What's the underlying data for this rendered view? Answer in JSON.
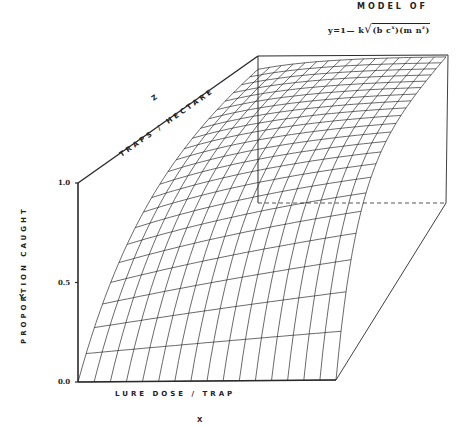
{
  "chart_data": {
    "type": "surface-3d-wireframe",
    "title": "MODEL OF",
    "subtitle": "y=1— k√(bc^x)(mn^z)",
    "equation_display": {
      "prefix": "y=1— k",
      "radicand": "(b c",
      "sup1": "x",
      "mid": ")(m n",
      "sup2": "z",
      "suffix": ")"
    },
    "xlabel": "LURE DOSE / TRAP",
    "xaxis_letter": "X",
    "ylabel": "PROPORTION CAUGHT",
    "yaxis_letter": "Y",
    "zlabel": "TRAPS / HECTARE",
    "zaxis_letter": "Z",
    "ylim": [
      0.0,
      1.0
    ],
    "yticks": [
      "0.0",
      "0.5",
      "1.0"
    ],
    "grid_x_lines": 16,
    "grid_z_lines": 22,
    "surface_samples": {
      "x_normalized": [
        0.0,
        0.5,
        1.0
      ],
      "z_normalized": [
        0.0,
        0.5,
        1.0
      ],
      "y_values": [
        [
          0.0,
          0.0,
          0.0
        ],
        [
          0.7,
          0.82,
          0.9
        ],
        [
          0.91,
          0.98,
          1.0
        ]
      ],
      "note_axes": "rows = z, cols = x"
    },
    "box": {
      "front_bottom_left": [
        78,
        382
      ],
      "front_bottom_right": [
        336,
        380
      ],
      "front_top_left": [
        78,
        183
      ],
      "back_bottom_left": [
        258,
        203
      ],
      "back_bottom_right": [
        446,
        203
      ],
      "back_top_left": [
        258,
        56
      ],
      "back_top_right": [
        448,
        55
      ]
    },
    "line_color": "#2a2a2a"
  }
}
